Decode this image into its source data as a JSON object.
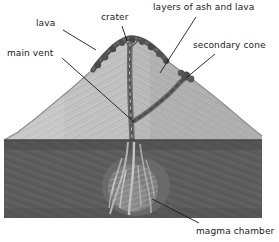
{
  "diagram": {
    "style": "pencil-sketch",
    "background_color": "#ffffff",
    "colors": {
      "cone_light": "#c9c9c9",
      "cone_mid": "#b0b0b0",
      "cone_shadow": "#9a9a9a",
      "underground_dark": "#5e5e5e",
      "underground_darker": "#4e4e4e",
      "lava_dark": "#4a4a4a",
      "vent_dark": "#6a6a6a",
      "magma_light": "#b9b9b9",
      "leader_line": "#1a1a1a",
      "label_text": "#1a1a1a"
    },
    "labels": [
      {
        "id": "lava",
        "text": "lava",
        "x": 36,
        "y": 23
      },
      {
        "id": "crater",
        "text": "crater",
        "x": 101,
        "y": 17
      },
      {
        "id": "ash-layers",
        "text": "layers of ash and lava",
        "x": 155,
        "y": 6
      },
      {
        "id": "main-vent",
        "text": "main vent",
        "x": 8,
        "y": 52
      },
      {
        "id": "secondary",
        "text": "secondary cone",
        "x": 194,
        "y": 44
      },
      {
        "id": "magma",
        "text": "magma chamber",
        "x": 198,
        "y": 229
      }
    ],
    "leader_lines": [
      {
        "id": "lava-leader",
        "x1": 63,
        "y1": 30,
        "x2": 96,
        "y2": 50
      },
      {
        "id": "crater-leader",
        "x1": 122,
        "y1": 26,
        "x2": 127,
        "y2": 41
      },
      {
        "id": "ash-layers-leader",
        "x1": 196,
        "y1": 17,
        "x2": 160,
        "y2": 73
      },
      {
        "id": "main-vent-leader",
        "x1": 62,
        "y1": 58,
        "x2": 134,
        "y2": 122
      },
      {
        "id": "secondary-leader",
        "x1": 215,
        "y1": 54,
        "x2": 186,
        "y2": 78
      },
      {
        "id": "magma-leader",
        "x1": 199,
        "y1": 223,
        "x2": 152,
        "y2": 199
      }
    ],
    "features": {
      "ground_line_y": 140,
      "summit": {
        "x": 130,
        "y": 38
      },
      "main_vent_axis_x": 131,
      "secondary_vent": "branch from main vent rising to the right flank",
      "magma_chamber": "streaked light plume in the dark subsurface block"
    }
  }
}
